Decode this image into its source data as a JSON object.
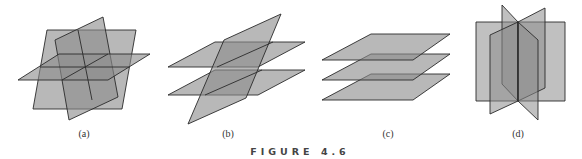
{
  "figure": {
    "title": "FIGURE 4.6",
    "colors": {
      "plane_fill": "#8c8c8c",
      "plane_opacity": 0.62,
      "edge": "#2a2a2a",
      "caption": "#333333"
    },
    "panels": [
      {
        "id": "a",
        "label": "(a)",
        "description": "three planes intersecting in a single point"
      },
      {
        "id": "b",
        "label": "(b)",
        "description": "two parallel planes cut by a third plane"
      },
      {
        "id": "c",
        "label": "(c)",
        "description": "three parallel planes"
      },
      {
        "id": "d",
        "label": "(d)",
        "description": "three planes intersecting in a common line"
      }
    ]
  }
}
